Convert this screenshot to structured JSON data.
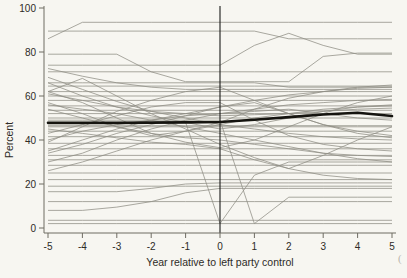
{
  "chart_data": {
    "type": "line",
    "title": "",
    "subtitle": "",
    "xlabel": "Year relative to left party control",
    "ylabel": "Percent",
    "xlim": [
      -5,
      5
    ],
    "ylim": [
      0,
      100
    ],
    "x": [
      -5,
      -4,
      -3,
      -2,
      -1,
      0,
      1,
      2,
      3,
      4,
      5
    ],
    "xticks": [
      -5,
      -4,
      -3,
      -2,
      -1,
      0,
      1,
      2,
      3,
      4,
      5
    ],
    "xticklabels": [
      "-5",
      "-4",
      "-3",
      "-2",
      "-1",
      "0",
      "1",
      "2",
      "3",
      "4",
      "5"
    ],
    "yticks": [
      0,
      20,
      40,
      60,
      80,
      100
    ],
    "yticklabels": [
      "0",
      "20",
      "40",
      "60",
      "80",
      "100"
    ],
    "grid": false,
    "legend": null,
    "annotations": [
      {
        "type": "vline",
        "x": 0,
        "label": "left party control onset"
      }
    ],
    "colors": {
      "background": "#f7f6f1",
      "series": "#8e8d84",
      "highlight": "#15140f",
      "axis": "#6e6c63",
      "text": "#2d2b26"
    },
    "series": [
      {
        "name": "mean",
        "highlight": true,
        "values": [
          47.8,
          47.8,
          47.8,
          47.9,
          48.0,
          48.2,
          49.2,
          50.4,
          51.6,
          52.4,
          50.9
        ]
      },
      {
        "name": "unit-01",
        "values": [
          86.0,
          93.5,
          93.5,
          93.5,
          93.5,
          93.5,
          93.5,
          93.5,
          93.5,
          93.5,
          93.5
        ]
      },
      {
        "name": "unit-02",
        "values": [
          89.5,
          89.5,
          89.5,
          89.5,
          89.5,
          89.5,
          89.5,
          86.0,
          86.0,
          86.0,
          86.0
        ]
      },
      {
        "name": "unit-03",
        "values": [
          74.0,
          74.0,
          74.0,
          74.0,
          74.0,
          74.0,
          83.0,
          88.5,
          83.0,
          79.0,
          79.0
        ]
      },
      {
        "name": "unit-04",
        "values": [
          79.0,
          79.0,
          79.0,
          71.0,
          66.5,
          66.5,
          66.5,
          66.5,
          78.0,
          79.5,
          79.5
        ]
      },
      {
        "name": "unit-05",
        "values": [
          71.0,
          71.0,
          71.0,
          71.0,
          71.0,
          71.0,
          71.0,
          71.0,
          71.0,
          71.0,
          71.0
        ]
      },
      {
        "name": "unit-06",
        "values": [
          72.5,
          69.0,
          66.0,
          64.0,
          63.0,
          63.0,
          63.0,
          63.0,
          63.0,
          63.0,
          63.0
        ]
      },
      {
        "name": "unit-07",
        "values": [
          66.0,
          66.0,
          66.0,
          66.0,
          66.0,
          66.0,
          66.0,
          64.0,
          64.0,
          64.0,
          64.0
        ]
      },
      {
        "name": "unit-08",
        "values": [
          64.5,
          64.5,
          64.5,
          64.5,
          64.5,
          64.5,
          64.5,
          64.5,
          64.5,
          64.5,
          64.5
        ]
      },
      {
        "name": "unit-09",
        "values": [
          62.0,
          62.0,
          62.0,
          62.0,
          62.0,
          62.0,
          62.0,
          62.0,
          62.0,
          62.0,
          62.0
        ]
      },
      {
        "name": "unit-10",
        "values": [
          60.0,
          60.0,
          60.0,
          60.0,
          60.0,
          60.0,
          60.0,
          60.0,
          60.0,
          60.0,
          60.0
        ]
      },
      {
        "name": "unit-11",
        "values": [
          58.0,
          58.0,
          58.0,
          58.0,
          58.0,
          58.0,
          58.0,
          58.0,
          58.0,
          58.0,
          58.0
        ]
      },
      {
        "name": "unit-12",
        "values": [
          55.5,
          55.5,
          55.5,
          55.5,
          55.5,
          55.5,
          55.5,
          55.5,
          55.5,
          55.5,
          55.5
        ]
      },
      {
        "name": "unit-13",
        "values": [
          68.5,
          63.0,
          57.5,
          53.0,
          50.0,
          47.0,
          45.0,
          43.0,
          41.5,
          40.5,
          40.0
        ]
      },
      {
        "name": "unit-14",
        "values": [
          34.0,
          38.0,
          43.0,
          47.0,
          51.0,
          55.0,
          58.0,
          60.5,
          62.0,
          63.5,
          64.0
        ]
      },
      {
        "name": "unit-15",
        "values": [
          52.0,
          52.0,
          52.0,
          52.0,
          52.0,
          52.0,
          52.0,
          52.0,
          52.0,
          52.0,
          52.0
        ]
      },
      {
        "name": "unit-16",
        "values": [
          50.0,
          50.0,
          50.0,
          50.0,
          50.0,
          50.0,
          50.0,
          50.0,
          50.0,
          50.0,
          50.0
        ]
      },
      {
        "name": "unit-17",
        "values": [
          46.5,
          46.5,
          46.5,
          46.5,
          46.5,
          46.5,
          46.5,
          46.5,
          46.5,
          46.5,
          46.5
        ]
      },
      {
        "name": "unit-18",
        "values": [
          44.0,
          44.0,
          44.0,
          44.0,
          44.0,
          44.0,
          44.0,
          44.0,
          44.0,
          44.0,
          44.0
        ]
      },
      {
        "name": "unit-19",
        "values": [
          41.5,
          41.5,
          41.5,
          41.5,
          41.5,
          41.5,
          41.5,
          41.5,
          41.5,
          41.5,
          41.5
        ]
      },
      {
        "name": "unit-20",
        "values": [
          38.5,
          38.5,
          38.5,
          38.5,
          38.5,
          38.5,
          38.5,
          38.5,
          38.5,
          38.5,
          38.5
        ]
      },
      {
        "name": "unit-21",
        "values": [
          36.0,
          36.0,
          36.0,
          36.0,
          36.0,
          36.0,
          36.0,
          36.0,
          36.0,
          36.0,
          36.0
        ]
      },
      {
        "name": "unit-22",
        "values": [
          62.0,
          57.0,
          50.0,
          43.0,
          39.0,
          36.5,
          40.0,
          46.0,
          52.0,
          57.0,
          60.0
        ]
      },
      {
        "name": "unit-23",
        "values": [
          30.0,
          34.0,
          40.0,
          45.0,
          49.0,
          52.0,
          54.0,
          56.0,
          57.0,
          58.0,
          58.5
        ]
      },
      {
        "name": "unit-24",
        "values": [
          56.0,
          54.0,
          52.0,
          49.0,
          46.0,
          43.0,
          40.0,
          37.0,
          34.0,
          31.5,
          30.0
        ]
      },
      {
        "name": "unit-25",
        "values": [
          31.0,
          31.0,
          31.0,
          31.0,
          31.0,
          31.0,
          31.0,
          31.0,
          31.0,
          31.0,
          31.0
        ]
      },
      {
        "name": "unit-26",
        "values": [
          28.5,
          28.5,
          28.5,
          28.5,
          28.5,
          28.5,
          28.5,
          28.5,
          28.5,
          28.5,
          28.5
        ]
      },
      {
        "name": "unit-27",
        "values": [
          25.0,
          25.0,
          25.0,
          25.0,
          25.0,
          25.0,
          25.0,
          25.0,
          25.0,
          25.0,
          25.0
        ]
      },
      {
        "name": "unit-28",
        "values": [
          45.0,
          43.0,
          41.0,
          39.0,
          38.0,
          36.0,
          31.0,
          27.0,
          24.0,
          22.5,
          22.0
        ]
      },
      {
        "name": "unit-29",
        "values": [
          22.0,
          22.0,
          22.0,
          22.0,
          22.0,
          22.0,
          22.0,
          22.0,
          22.0,
          22.0,
          22.0
        ]
      },
      {
        "name": "unit-30",
        "values": [
          19.0,
          19.0,
          19.0,
          19.0,
          19.0,
          19.0,
          19.0,
          19.0,
          19.0,
          19.0,
          19.0
        ]
      },
      {
        "name": "unit-31",
        "values": [
          16.5,
          16.5,
          16.5,
          18.0,
          20.0,
          20.5,
          20.5,
          20.5,
          20.5,
          20.5,
          20.5
        ]
      },
      {
        "name": "unit-32",
        "values": [
          8.0,
          8.0,
          9.5,
          12.0,
          16.0,
          18.0,
          18.0,
          18.0,
          18.0,
          18.0,
          18.0
        ]
      },
      {
        "name": "unit-33",
        "values": [
          3.5,
          3.5,
          3.5,
          3.5,
          3.5,
          3.5,
          3.5,
          3.5,
          3.5,
          3.5,
          3.5
        ]
      },
      {
        "name": "unit-34",
        "values": [
          2.0,
          2.0,
          2.0,
          2.0,
          2.0,
          2.0,
          2.0,
          2.0,
          2.0,
          2.0,
          2.0
        ]
      },
      {
        "name": "unit-35",
        "values": [
          48.0,
          48.0,
          48.0,
          48.0,
          48.0,
          2.0,
          24.0,
          30.0,
          30.0,
          30.0,
          30.0
        ]
      },
      {
        "name": "unit-36",
        "values": [
          49.0,
          49.0,
          49.0,
          49.0,
          49.0,
          49.0,
          2.0,
          14.0,
          14.0,
          14.0,
          14.0
        ]
      },
      {
        "name": "unit-37",
        "values": [
          62.0,
          68.0,
          60.0,
          52.0,
          45.0,
          38.0,
          32.0,
          27.0,
          33.0,
          40.0,
          46.0
        ]
      },
      {
        "name": "unit-38",
        "values": [
          39.0,
          46.0,
          53.0,
          58.0,
          62.0,
          64.0,
          58.0,
          52.0,
          47.0,
          43.0,
          41.0
        ]
      },
      {
        "name": "unit-39",
        "values": [
          57.0,
          52.0,
          46.0,
          42.0,
          44.0,
          48.0,
          54.0,
          59.0,
          62.0,
          64.0,
          65.0
        ]
      },
      {
        "name": "unit-40",
        "values": [
          43.0,
          47.0,
          51.0,
          55.0,
          57.0,
          57.0,
          49.0,
          42.0,
          38.0,
          36.0,
          35.0
        ]
      },
      {
        "name": "unit-41",
        "values": [
          35.0,
          40.0,
          45.0,
          49.0,
          52.0,
          55.0,
          57.0,
          52.0,
          47.0,
          44.0,
          42.0
        ]
      },
      {
        "name": "unit-42",
        "values": [
          66.0,
          60.0,
          55.0,
          51.0,
          48.0,
          45.0,
          47.0,
          50.0,
          53.0,
          55.0,
          56.0
        ]
      },
      {
        "name": "unit-43",
        "values": [
          26.0,
          30.0,
          35.0,
          40.0,
          44.0,
          47.0,
          50.0,
          52.0,
          54.0,
          55.0,
          55.5
        ]
      },
      {
        "name": "unit-44",
        "values": [
          54.0,
          50.0,
          46.0,
          43.0,
          41.0,
          40.0,
          38.0,
          36.0,
          34.0,
          33.0,
          32.5
        ]
      },
      {
        "name": "unit-45",
        "values": [
          40.0,
          44.0,
          47.0,
          49.0,
          51.0,
          52.0,
          53.0,
          54.0,
          52.0,
          50.0,
          49.0
        ]
      },
      {
        "name": "unit-46",
        "values": [
          61.0,
          58.0,
          55.0,
          53.0,
          52.0,
          51.0,
          51.5,
          52.0,
          53.0,
          54.0,
          54.5
        ]
      },
      {
        "name": "unit-47",
        "values": [
          12.0,
          12.0,
          12.0,
          12.0,
          12.0,
          12.0,
          12.0,
          12.0,
          12.0,
          12.0,
          12.0
        ]
      },
      {
        "name": "unit-48",
        "values": [
          46.0,
          46.0,
          46.0,
          46.0,
          46.0,
          46.0,
          46.0,
          46.0,
          46.0,
          46.0,
          46.0
        ]
      },
      {
        "name": "unit-49",
        "values": [
          33.0,
          33.0,
          33.0,
          33.0,
          33.0,
          33.0,
          33.0,
          33.0,
          33.0,
          33.0,
          33.0
        ]
      },
      {
        "name": "unit-50",
        "values": [
          53.5,
          53.5,
          53.5,
          53.5,
          53.5,
          53.5,
          53.5,
          53.5,
          53.5,
          53.5,
          53.5
        ]
      }
    ]
  },
  "corner": {
    "mark": "("
  }
}
